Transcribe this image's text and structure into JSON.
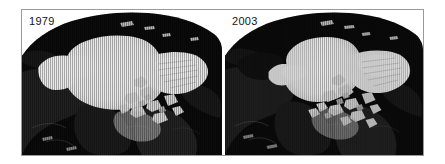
{
  "figure": {
    "type": "satellite-image-comparison",
    "frame_border_color": "#9a9a9a",
    "background_color": "#ffffff",
    "panel_count": 2
  },
  "panels": [
    {
      "id": "panel-left",
      "year_label": "1979",
      "label_color": "#151515",
      "ice_color": "#ffffff",
      "ocean_color": "#0d0d0d",
      "land_color": "#2a2a2a",
      "ice_extent_relative": "larger"
    },
    {
      "id": "panel-right",
      "year_label": "2003",
      "label_color": "#151515",
      "ice_color": "#ffffff",
      "ocean_color": "#0d0d0d",
      "land_color": "#2a2a2a",
      "ice_extent_relative": "smaller"
    }
  ]
}
